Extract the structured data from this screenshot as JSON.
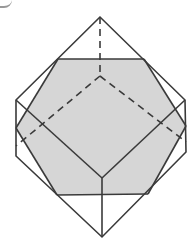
{
  "figure": {
    "colors": {
      "line": "#3a3a3a",
      "shaded_face": "#d6d6d6",
      "background": "#ffffff"
    },
    "outer_solid": {
      "top_apex": [
        100,
        17
      ],
      "upper_left": [
        16,
        100
      ],
      "lower_left": [
        16,
        156
      ],
      "bottom_apex": [
        102,
        237
      ],
      "lower_right": [
        186,
        152
      ],
      "upper_right": [
        185,
        100
      ]
    },
    "shaded_hexagon": {
      "top_left": [
        58,
        59
      ],
      "top_right": [
        144,
        59
      ],
      "right": [
        186,
        126
      ],
      "bottom_right": [
        148,
        194
      ],
      "bottom_left": [
        57,
        195
      ],
      "left": [
        16,
        128
      ]
    },
    "front_vertex": [
      102,
      178
    ],
    "hidden_vertex": [
      100,
      76
    ]
  }
}
